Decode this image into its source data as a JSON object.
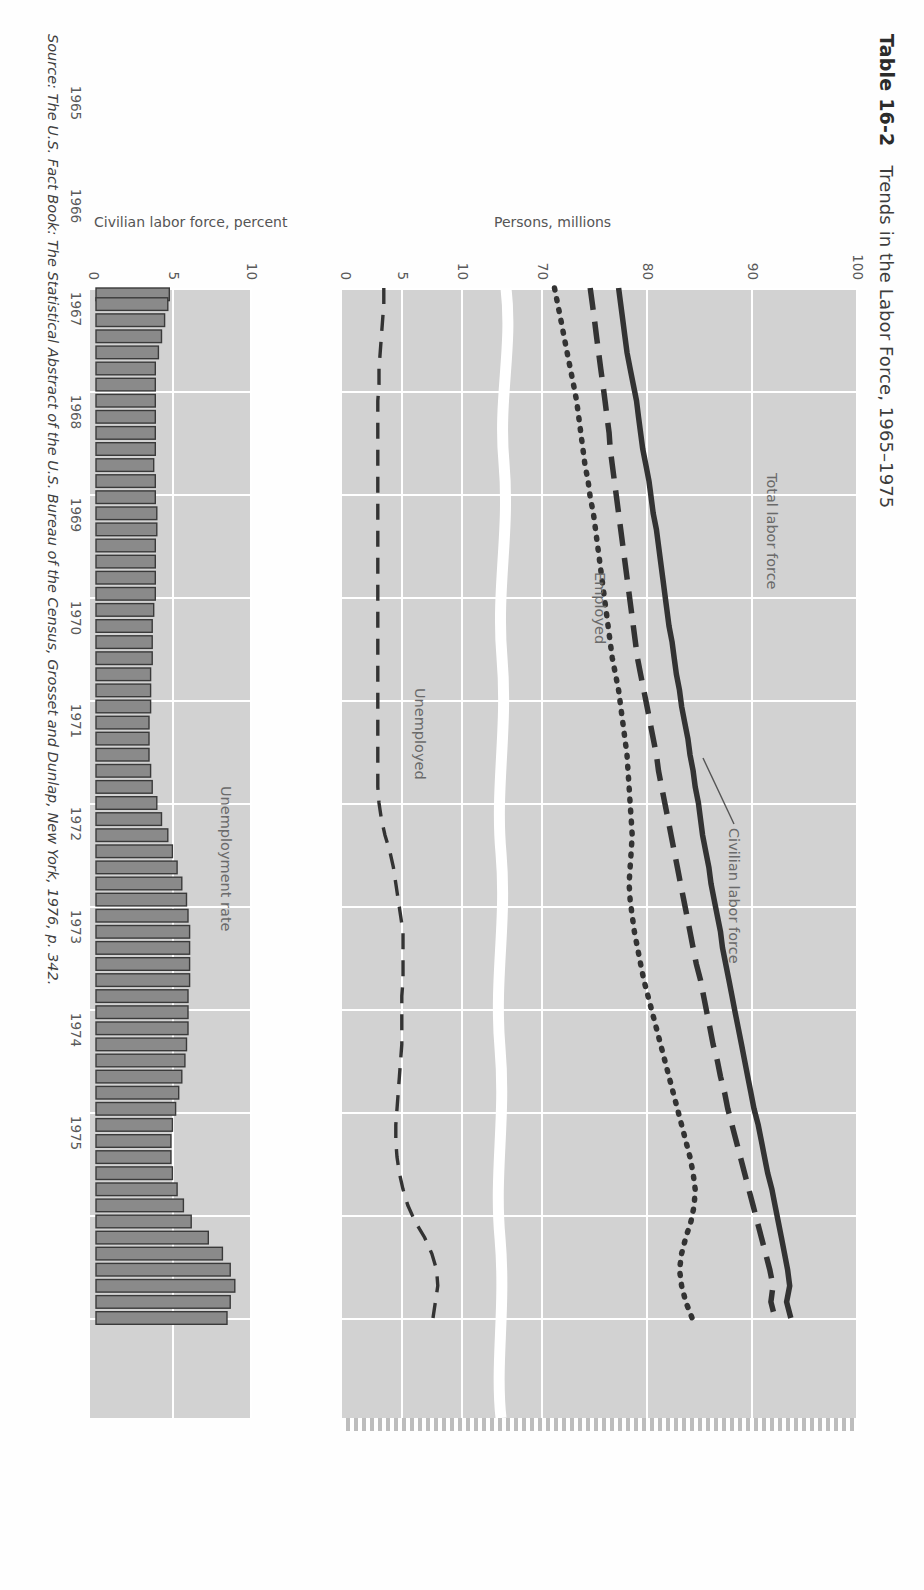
{
  "figure": {
    "table_number": "Table 16-2",
    "title": "Trends in the Labor Force, 1965–1975",
    "source": "Source: The U.S. Fact Book: The Statistical Abstract of the U.S. Bureau of the Census, Grosset and Dunlap, New York, 1976, p. 342."
  },
  "chart_data": [
    {
      "type": "line",
      "title": "Trends in the Labor Force, 1965–1975",
      "xlabel": "",
      "ylabel": "Persons, millions",
      "xlim": [
        1965,
        1975.5
      ],
      "axis_break": true,
      "upper_panel_ylim": [
        70,
        100
      ],
      "lower_panel_ylim": [
        0,
        10
      ],
      "ytick_labels_upper": [
        "100",
        "90",
        "80",
        "70"
      ],
      "ytick_labels_lower": [
        "10",
        "5",
        "0"
      ],
      "xtick_labels": [
        "1965",
        "1966",
        "1967",
        "1968",
        "1969",
        "1970",
        "1971",
        "1972",
        "1973",
        "1974",
        "1975"
      ],
      "grid": true,
      "legend_position": "inline-annotations",
      "series": [
        {
          "name": "Total labor force",
          "style": "solid",
          "values": [
            77.2,
            77.4,
            77.6,
            77.8,
            78.0,
            78.3,
            78.6,
            78.9,
            79.1,
            79.3,
            79.5,
            79.8,
            80.1,
            80.3,
            80.5,
            80.8,
            81.0,
            81.2,
            81.4,
            81.6,
            81.8,
            82.0,
            82.3,
            82.5,
            82.7,
            83.0,
            83.2,
            83.5,
            83.8,
            84.0,
            84.3,
            84.5,
            84.8,
            85.0,
            85.2,
            85.5,
            85.8,
            86.0,
            86.3,
            86.6,
            86.9,
            87.1,
            87.4,
            87.7,
            88.0,
            88.3,
            88.6,
            88.9,
            89.2,
            89.5,
            89.8,
            90.1,
            90.5,
            90.8,
            91.1,
            91.4,
            91.8,
            92.1,
            92.4,
            92.7,
            93.0,
            93.3,
            93.5,
            93.2,
            93.6
          ]
        },
        {
          "name": "Civilian labor force",
          "style": "dashed",
          "values": [
            74.5,
            74.7,
            74.9,
            75.1,
            75.3,
            75.5,
            75.7,
            75.9,
            76.1,
            76.3,
            76.4,
            76.6,
            76.8,
            77.0,
            77.2,
            77.4,
            77.6,
            77.8,
            78.0,
            78.2,
            78.4,
            78.6,
            78.8,
            79.0,
            79.3,
            79.6,
            79.9,
            80.2,
            80.5,
            80.8,
            81.0,
            81.3,
            81.6,
            81.9,
            82.2,
            82.5,
            82.8,
            83.1,
            83.4,
            83.7,
            84.0,
            84.3,
            84.6,
            85.0,
            85.3,
            85.6,
            85.9,
            86.2,
            86.6,
            86.9,
            87.3,
            87.6,
            88.0,
            88.4,
            88.8,
            89.2,
            89.6,
            90.0,
            90.4,
            90.8,
            91.2,
            91.6,
            91.9,
            91.7,
            92.1
          ]
        },
        {
          "name": "Employed",
          "style": "dotted",
          "values": [
            71.1,
            71.4,
            71.7,
            72.0,
            72.3,
            72.6,
            72.9,
            73.2,
            73.4,
            73.6,
            73.8,
            74.0,
            74.3,
            74.5,
            74.8,
            75.0,
            75.2,
            75.4,
            75.6,
            75.8,
            76.0,
            76.2,
            76.4,
            76.6,
            76.9,
            77.2,
            77.4,
            77.6,
            77.8,
            78.0,
            78.1,
            78.2,
            78.3,
            78.4,
            78.5,
            78.4,
            78.3,
            78.2,
            78.3,
            78.5,
            78.7,
            79.0,
            79.3,
            79.6,
            80.0,
            80.4,
            80.8,
            81.2,
            81.6,
            82.0,
            82.4,
            82.8,
            83.2,
            83.6,
            84.0,
            84.3,
            84.5,
            84.4,
            84.1,
            83.6,
            83.2,
            83.0,
            83.2,
            83.6,
            84.2
          ]
        },
        {
          "name": "Unemployed",
          "style": "dashed-thin",
          "panel": "lower",
          "values": [
            3.4,
            3.4,
            3.3,
            3.2,
            3.1,
            3.0,
            3.0,
            2.9,
            2.9,
            2.9,
            2.9,
            2.9,
            2.9,
            2.9,
            2.9,
            2.9,
            2.9,
            2.9,
            2.9,
            2.9,
            2.9,
            2.9,
            2.9,
            2.9,
            2.9,
            2.9,
            2.9,
            2.9,
            2.9,
            2.9,
            2.9,
            2.9,
            3.0,
            3.2,
            3.5,
            3.9,
            4.2,
            4.4,
            4.6,
            4.8,
            5.0,
            5.0,
            5.0,
            5.0,
            4.9,
            4.9,
            4.9,
            4.9,
            4.8,
            4.7,
            4.6,
            4.5,
            4.4,
            4.4,
            4.5,
            4.7,
            5.0,
            5.4,
            6.0,
            6.8,
            7.4,
            7.8,
            7.9,
            7.7,
            7.5
          ]
        }
      ],
      "annotations": [
        "Total labor force",
        "Civilian labor force",
        "Employed",
        "Unemployed"
      ]
    },
    {
      "type": "bar",
      "title": "Unemployment rate",
      "xlabel": "",
      "ylabel": "Civilian labor force, percent",
      "ylim": [
        0,
        10
      ],
      "ytick_labels": [
        "10",
        "5",
        "0"
      ],
      "xtick_labels": [
        "1965",
        "1966",
        "1967",
        "1968",
        "1969",
        "1970",
        "1971",
        "1972",
        "1973",
        "1974",
        "1975"
      ],
      "categories": [
        "1965",
        "1966",
        "1967",
        "1968",
        "1969",
        "1970",
        "1971",
        "1972",
        "1973",
        "1974",
        "1975"
      ],
      "values": [
        4.7,
        4.6,
        4.4,
        4.2,
        4.0,
        3.8,
        3.8,
        3.8,
        3.8,
        3.8,
        3.8,
        3.7,
        3.8,
        3.8,
        3.9,
        3.9,
        3.8,
        3.8,
        3.8,
        3.8,
        3.7,
        3.6,
        3.6,
        3.6,
        3.5,
        3.5,
        3.5,
        3.4,
        3.4,
        3.4,
        3.5,
        3.6,
        3.9,
        4.2,
        4.6,
        4.9,
        5.2,
        5.5,
        5.8,
        5.9,
        6.0,
        6.0,
        6.0,
        6.0,
        5.9,
        5.9,
        5.9,
        5.8,
        5.7,
        5.5,
        5.3,
        5.1,
        4.9,
        4.8,
        4.8,
        4.9,
        5.2,
        5.6,
        6.1,
        7.2,
        8.1,
        8.6,
        8.9,
        8.6,
        8.4
      ],
      "annotation": "Unemployment rate"
    }
  ],
  "labels": {
    "ylabel_top": "Persons, millions",
    "ylabel_bottom": "Civilian labor force, percent",
    "series": {
      "total": "Total labor force",
      "civilian": "Civilian labor force",
      "employed": "Employed",
      "unemployed": "Unemployed",
      "rate": "Unemployment rate"
    }
  },
  "colors": {
    "plot_background": "#d2d2d2",
    "grid": "#ffffff",
    "ink": "#333333",
    "bar_fill": "#8a8a8a",
    "page": "#fefefe"
  }
}
